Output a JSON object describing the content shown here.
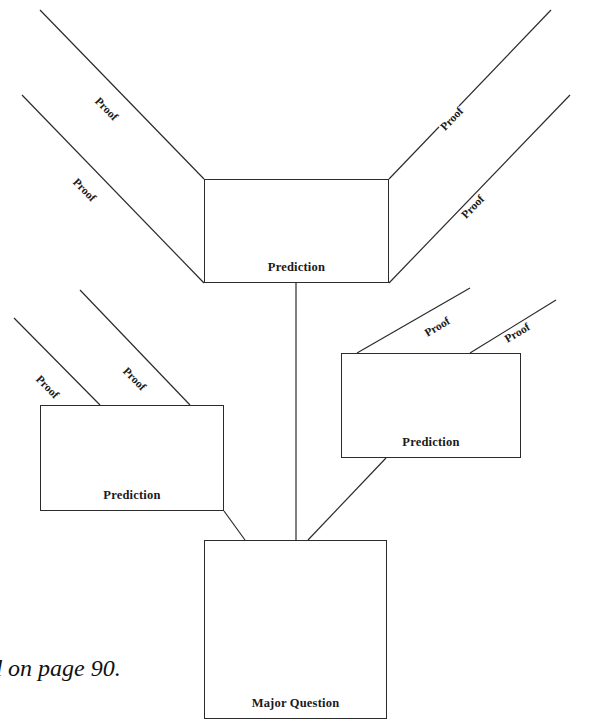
{
  "figure": {
    "caption_fragment": "d on page 90."
  },
  "nodes": [
    {
      "id": "prediction-top",
      "label": "Prediction",
      "x": 204,
      "y": 179,
      "w": 185,
      "h": 104
    },
    {
      "id": "prediction-right",
      "label": "Prediction",
      "x": 341,
      "y": 353,
      "w": 180,
      "h": 105
    },
    {
      "id": "prediction-left",
      "label": "Prediction",
      "x": 40,
      "y": 405,
      "w": 184,
      "h": 106
    },
    {
      "id": "major-question",
      "label": "Major Question",
      "x": 204,
      "y": 540,
      "w": 183,
      "h": 179
    }
  ],
  "edges": [
    {
      "id": "edge-top-proof-1",
      "label": "Proof",
      "x1": 40,
      "y1": 10,
      "x2": 204,
      "y2": 179
    },
    {
      "id": "edge-top-proof-2",
      "label": "Proof",
      "x1": 22,
      "y1": 95,
      "x2": 204,
      "y2": 283
    },
    {
      "id": "edge-top-proof-3",
      "label": "Proof",
      "x1": 551,
      "y1": 10,
      "x2": 389,
      "y2": 179
    },
    {
      "id": "edge-top-proof-4",
      "label": "Proof",
      "x1": 570,
      "y1": 95,
      "x2": 389,
      "y2": 283
    },
    {
      "id": "edge-left-proof-1",
      "label": "Proof",
      "x1": 14,
      "y1": 318,
      "x2": 100,
      "y2": 405
    },
    {
      "id": "edge-left-proof-2",
      "label": "Proof",
      "x1": 80,
      "y1": 290,
      "x2": 190,
      "y2": 405
    },
    {
      "id": "edge-right-proof-1",
      "label": "Proof",
      "x1": 470,
      "y1": 288,
      "x2": 357,
      "y2": 353
    },
    {
      "id": "edge-right-proof-2",
      "label": "Proof",
      "x1": 556,
      "y1": 300,
      "x2": 470,
      "y2": 353
    },
    {
      "id": "edge-top-to-major",
      "label": "",
      "x1": 296,
      "y1": 283,
      "x2": 296,
      "y2": 540
    },
    {
      "id": "edge-left-to-major",
      "label": "",
      "x1": 224,
      "y1": 511,
      "x2": 245,
      "y2": 540
    },
    {
      "id": "edge-right-to-major",
      "label": "",
      "x1": 386,
      "y1": 458,
      "x2": 308,
      "y2": 540
    }
  ],
  "edge_labels": [
    {
      "text": "Proof",
      "x": 96,
      "y": 93,
      "rotate": 46
    },
    {
      "text": "Proof",
      "x": 74,
      "y": 174,
      "rotate": 46
    },
    {
      "text": "Proof",
      "x": 442,
      "y": 124,
      "rotate": -46
    },
    {
      "text": "Proof",
      "x": 463,
      "y": 212,
      "rotate": -46
    },
    {
      "text": "Proof",
      "x": 37,
      "y": 371,
      "rotate": 46
    },
    {
      "text": "Proof",
      "x": 124,
      "y": 363,
      "rotate": 46
    },
    {
      "text": "Proof",
      "x": 425,
      "y": 329,
      "rotate": -31
    },
    {
      "text": "Proof",
      "x": 505,
      "y": 335,
      "rotate": -31
    }
  ],
  "style": {
    "stroke": "#2b2b2b",
    "stroke_width": 1.2,
    "background": "#ffffff",
    "text_color": "#1a1a1a"
  }
}
